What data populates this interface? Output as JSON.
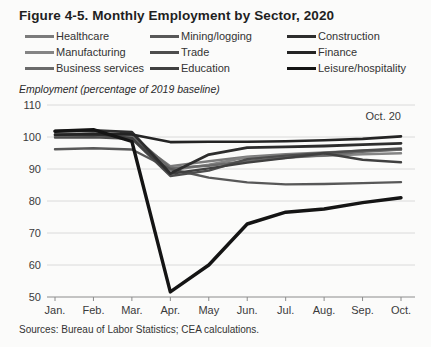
{
  "figure": {
    "title": "Figure 4-5. Monthly Employment by Sector, 2020",
    "axis_unit_label": "Employment (percentage of 2019 baseline)",
    "sources": "Sources: Bureau of Labor Statistics; CEA calculations."
  },
  "colors": {
    "background": "#fbfbfa",
    "title_text": "#1f1f1f",
    "label_text": "#3a3a3a",
    "gridline": "#dadada",
    "axis_line": "#8c8c8c"
  },
  "chart_data": {
    "type": "line",
    "title": "Figure 4-5. Monthly Employment by Sector, 2020",
    "ylabel": "Employment (percentage of 2019 baseline)",
    "xlabel": "",
    "annotation": "Oct. 20",
    "ylim": [
      50,
      110
    ],
    "yticks": [
      110,
      100,
      90,
      80,
      70,
      60,
      50
    ],
    "grid": "horizontal",
    "legend_position": "top",
    "x": [
      "Jan.",
      "Feb.",
      "Mar.",
      "Apr.",
      "May",
      "Jun.",
      "Jul.",
      "Aug.",
      "Sep.",
      "Oct."
    ],
    "series": [
      {
        "key": "healthcare",
        "name": "Healthcare",
        "color": "#7b7b7b",
        "width": 2.4,
        "values": [
          100.3,
          100.5,
          99.6,
          90.9,
          92.4,
          93.8,
          94.6,
          95.2,
          95.7,
          96.1
        ]
      },
      {
        "key": "manufacturing",
        "name": "Manufacturing",
        "color": "#848484",
        "width": 2.4,
        "values": [
          100.1,
          100.2,
          99.9,
          89.6,
          91.3,
          93.7,
          93.9,
          94.1,
          94.6,
          94.9
        ]
      },
      {
        "key": "business-services",
        "name": "Business services",
        "color": "#6a6a6a",
        "width": 2.4,
        "values": [
          100.9,
          101.2,
          100.7,
          90.3,
          91.0,
          92.5,
          93.5,
          94.3,
          95.4,
          96.1
        ]
      },
      {
        "key": "mining-logging",
        "name": "Mining/logging",
        "color": "#585858",
        "width": 2.4,
        "values": [
          96.2,
          96.5,
          96.1,
          90.0,
          87.3,
          85.8,
          85.2,
          85.3,
          85.6,
          85.9
        ]
      },
      {
        "key": "trade",
        "name": "Trade",
        "color": "#4d4d4d",
        "width": 2.4,
        "values": [
          99.8,
          99.9,
          99.4,
          87.8,
          89.5,
          93.1,
          94.2,
          95.0,
          95.8,
          96.4
        ]
      },
      {
        "key": "education",
        "name": "Education",
        "color": "#404040",
        "width": 2.4,
        "values": [
          100.6,
          100.8,
          99.7,
          88.5,
          90.2,
          92.0,
          93.4,
          94.9,
          92.9,
          92.1
        ]
      },
      {
        "key": "construction",
        "name": "Construction",
        "color": "#2d2d2d",
        "width": 2.8,
        "values": [
          101.8,
          102.1,
          101.5,
          88.6,
          94.5,
          96.7,
          96.9,
          97.2,
          97.6,
          98.0
        ]
      },
      {
        "key": "finance",
        "name": "Finance",
        "color": "#242424",
        "width": 2.6,
        "values": [
          100.7,
          100.9,
          100.8,
          98.4,
          98.5,
          98.5,
          98.7,
          99.0,
          99.4,
          100.2
        ]
      },
      {
        "key": "leisure-hospitality",
        "name": "Leisure/hospitality",
        "color": "#141414",
        "width": 3.4,
        "values": [
          101.8,
          102.3,
          98.6,
          51.6,
          60.0,
          72.8,
          76.5,
          77.5,
          79.5,
          81.0
        ]
      }
    ]
  }
}
